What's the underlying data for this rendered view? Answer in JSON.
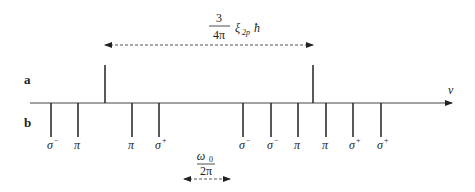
{
  "diagram": {
    "row_labels": {
      "a": "a",
      "b": "b"
    },
    "axis_label": "v",
    "top_annotation": {
      "numerator": "3",
      "denominator": "4π",
      "symbol": "ξ",
      "subscript": "2p",
      "suffix": "ħ"
    },
    "bottom_annotation": {
      "numerator": "ω",
      "numerator_sub": "0",
      "denominator": "2π"
    },
    "lines_a": [
      {
        "x": 105,
        "direction": "up"
      },
      {
        "x": 313,
        "direction": "up"
      }
    ],
    "lines_b": [
      {
        "x": 51,
        "label": "σ",
        "sup": "−"
      },
      {
        "x": 78,
        "label": "π",
        "sup": ""
      },
      {
        "x": 132,
        "label": "π",
        "sup": ""
      },
      {
        "x": 159,
        "label": "σ",
        "sup": "+"
      },
      {
        "x": 243,
        "label": "σ",
        "sup": "−"
      },
      {
        "x": 271,
        "label": "σ",
        "sup": "−"
      },
      {
        "x": 298,
        "label": "π",
        "sup": ""
      },
      {
        "x": 326,
        "label": "π",
        "sup": ""
      },
      {
        "x": 353,
        "label": "σ",
        "sup": "+"
      },
      {
        "x": 381,
        "label": "σ",
        "sup": "+"
      }
    ],
    "colors": {
      "line": "#222222",
      "axis": "#444444",
      "dash": "#555555"
    }
  }
}
